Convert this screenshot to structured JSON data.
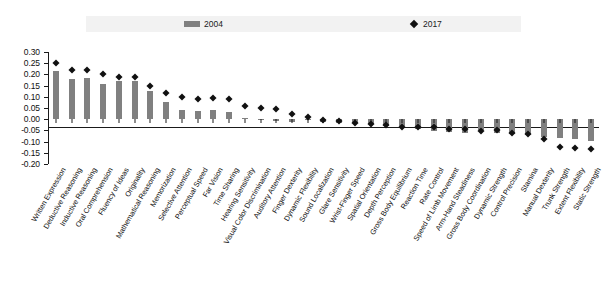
{
  "legend": {
    "entries": [
      {
        "label": "2004",
        "marker": "bar-swatch-icon",
        "color": "#808080"
      },
      {
        "label": "2017",
        "marker": "diamond-marker-icon",
        "color": "#111111"
      }
    ]
  },
  "footnote": {
    "text": ""
  },
  "chart_data": {
    "type": "bar",
    "title": "",
    "subtitle": "",
    "xlabel": "",
    "ylabel": "",
    "ylim": [
      -0.2,
      0.3
    ],
    "ytick_labels": [
      "0.30",
      "0.25",
      "0.20",
      "0.15",
      "0.10",
      "0.05",
      "0.00",
      "-0.05",
      "-0.10",
      "-0.15",
      "-0.20"
    ],
    "ytick_values": [
      0.3,
      0.25,
      0.2,
      0.15,
      0.1,
      0.05,
      0.0,
      -0.05,
      -0.1,
      -0.15,
      -0.2
    ],
    "grid": false,
    "legend_position": "top",
    "categories": [
      "Written Expression",
      "Deductive Reasoning",
      "Inductive Reasoning",
      "Oral Comprehension",
      "Fluency of Ideas",
      "Originality",
      "Mathematical Reasoning",
      "Memorization",
      "Selective Attention",
      "Perceptual Speed",
      "Far Vision",
      "Time Sharing",
      "Hearing Sensitivity",
      "Visual Color Discrimination",
      "Auditory Attention",
      "Finger Dexterity",
      "Dynamic Flexibility",
      "Sound Localization",
      "Glare Sensitivity",
      "Wrist-Finger Speed",
      "Spatial Orientation",
      "Depth Perception",
      "Gross Body Equilibrium",
      "Reaction Time",
      "Rate Control",
      "Speed of Limb Movement",
      "Arm-Hand Steadiness",
      "Gross Body Coordination",
      "Dynamic Strength",
      "Control Precision",
      "Stamina",
      "Manual Dexterity",
      "Trunk Strength",
      "Extent Flexibility",
      "Static Strength"
    ],
    "series": [
      {
        "name": "2004",
        "type": "bar",
        "color": "#808080",
        "values": [
          0.215,
          0.18,
          0.182,
          0.158,
          0.17,
          0.172,
          0.128,
          0.075,
          0.042,
          0.035,
          0.04,
          0.03,
          0.005,
          -0.003,
          -0.008,
          -0.012,
          -0.004,
          -0.012,
          -0.016,
          -0.018,
          -0.022,
          -0.03,
          -0.03,
          -0.046,
          -0.052,
          -0.056,
          -0.06,
          -0.05,
          -0.062,
          -0.068,
          -0.072,
          -0.078,
          -0.086,
          -0.09,
          -0.096
        ]
      },
      {
        "name": "2017",
        "type": "scatter",
        "color": "#111111",
        "marker": "diamond",
        "values": [
          0.25,
          0.218,
          0.218,
          0.2,
          0.188,
          0.19,
          0.15,
          0.118,
          0.098,
          0.09,
          0.095,
          0.088,
          0.06,
          0.048,
          0.045,
          0.022,
          0.008,
          -0.004,
          -0.01,
          -0.016,
          -0.02,
          -0.024,
          -0.034,
          -0.034,
          -0.036,
          -0.042,
          -0.044,
          -0.052,
          -0.05,
          -0.06,
          -0.064,
          -0.09,
          -0.122,
          -0.128,
          -0.132
        ]
      }
    ]
  }
}
